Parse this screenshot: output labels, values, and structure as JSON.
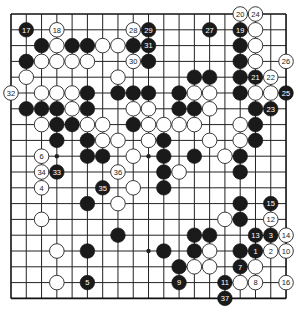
{
  "diagram": {
    "type": "go-board",
    "size": 19,
    "geometry": {
      "left": 11,
      "top": 14,
      "dx": 15.28,
      "dy": 15.8,
      "stone_radius": 7.3
    },
    "colors": {
      "black": "#1a1a1a",
      "white": "#ffffff",
      "line": "#222222",
      "background": "#ffffff"
    },
    "hoshi": [
      [
        3,
        3
      ],
      [
        9,
        3
      ],
      [
        15,
        3
      ],
      [
        3,
        9
      ],
      [
        9,
        9
      ],
      [
        15,
        9
      ],
      [
        3,
        15
      ],
      [
        9,
        15
      ],
      [
        15,
        15
      ]
    ],
    "stones": [
      {
        "c": 15,
        "r": 0,
        "color": "W",
        "label": "20"
      },
      {
        "c": 16,
        "r": 0,
        "color": "W",
        "label": "24"
      },
      {
        "c": 1,
        "r": 1,
        "color": "B",
        "label": "17"
      },
      {
        "c": 3,
        "r": 1,
        "color": "W",
        "label": "18"
      },
      {
        "c": 8,
        "r": 1,
        "color": "W",
        "label": "28"
      },
      {
        "c": 9,
        "r": 1,
        "color": "B",
        "label": "29"
      },
      {
        "c": 13,
        "r": 1,
        "color": "B",
        "label": "27"
      },
      {
        "c": 15,
        "r": 1,
        "color": "B",
        "label": "19"
      },
      {
        "c": 16,
        "r": 1,
        "color": "W",
        "label": ""
      },
      {
        "c": 2,
        "r": 2,
        "color": "B",
        "label": ""
      },
      {
        "c": 3,
        "r": 2,
        "color": "W",
        "label": ""
      },
      {
        "c": 4,
        "r": 2,
        "color": "B",
        "label": ""
      },
      {
        "c": 5,
        "r": 2,
        "color": "B",
        "label": ""
      },
      {
        "c": 6,
        "r": 2,
        "color": "W",
        "label": ""
      },
      {
        "c": 7,
        "r": 2,
        "color": "W",
        "label": ""
      },
      {
        "c": 8,
        "r": 2,
        "color": "B",
        "label": ""
      },
      {
        "c": 9,
        "r": 2,
        "color": "B",
        "label": "31"
      },
      {
        "c": 15,
        "r": 2,
        "color": "B",
        "label": ""
      },
      {
        "c": 16,
        "r": 2,
        "color": "W",
        "label": ""
      },
      {
        "c": 1,
        "r": 3,
        "color": "B",
        "label": ""
      },
      {
        "c": 2,
        "r": 3,
        "color": "W",
        "label": ""
      },
      {
        "c": 3,
        "r": 3,
        "color": "W",
        "label": ""
      },
      {
        "c": 4,
        "r": 3,
        "color": "W",
        "label": ""
      },
      {
        "c": 5,
        "r": 3,
        "color": "W",
        "label": ""
      },
      {
        "c": 8,
        "r": 3,
        "color": "W",
        "label": "30"
      },
      {
        "c": 9,
        "r": 3,
        "color": "B",
        "label": ""
      },
      {
        "c": 15,
        "r": 3,
        "color": "B",
        "label": ""
      },
      {
        "c": 16,
        "r": 3,
        "color": "W",
        "label": ""
      },
      {
        "c": 18,
        "r": 3,
        "color": "W",
        "label": "26"
      },
      {
        "c": 1,
        "r": 4,
        "color": "W",
        "label": ""
      },
      {
        "c": 7,
        "r": 4,
        "color": "W",
        "label": ""
      },
      {
        "c": 12,
        "r": 4,
        "color": "B",
        "label": ""
      },
      {
        "c": 13,
        "r": 4,
        "color": "B",
        "label": ""
      },
      {
        "c": 15,
        "r": 4,
        "color": "B",
        "label": ""
      },
      {
        "c": 16,
        "r": 4,
        "color": "B",
        "label": "21"
      },
      {
        "c": 17,
        "r": 4,
        "color": "W",
        "label": "22"
      },
      {
        "c": 0,
        "r": 5,
        "color": "W",
        "label": "32"
      },
      {
        "c": 2,
        "r": 5,
        "color": "W",
        "label": ""
      },
      {
        "c": 3,
        "r": 5,
        "color": "W",
        "label": ""
      },
      {
        "c": 4,
        "r": 5,
        "color": "W",
        "label": ""
      },
      {
        "c": 5,
        "r": 5,
        "color": "B",
        "label": ""
      },
      {
        "c": 7,
        "r": 5,
        "color": "B",
        "label": ""
      },
      {
        "c": 8,
        "r": 5,
        "color": "B",
        "label": ""
      },
      {
        "c": 9,
        "r": 5,
        "color": "B",
        "label": ""
      },
      {
        "c": 11,
        "r": 5,
        "color": "B",
        "label": ""
      },
      {
        "c": 12,
        "r": 5,
        "color": "W",
        "label": ""
      },
      {
        "c": 13,
        "r": 5,
        "color": "W",
        "label": ""
      },
      {
        "c": 15,
        "r": 5,
        "color": "B",
        "label": ""
      },
      {
        "c": 16,
        "r": 5,
        "color": "W",
        "label": ""
      },
      {
        "c": 17,
        "r": 5,
        "color": "W",
        "label": ""
      },
      {
        "c": 18,
        "r": 5,
        "color": "B",
        "label": "25"
      },
      {
        "c": 1,
        "r": 6,
        "color": "B",
        "label": ""
      },
      {
        "c": 2,
        "r": 6,
        "color": "B",
        "label": ""
      },
      {
        "c": 3,
        "r": 6,
        "color": "B",
        "label": ""
      },
      {
        "c": 4,
        "r": 6,
        "color": "W",
        "label": ""
      },
      {
        "c": 5,
        "r": 6,
        "color": "B",
        "label": ""
      },
      {
        "c": 8,
        "r": 6,
        "color": "W",
        "label": ""
      },
      {
        "c": 9,
        "r": 6,
        "color": "W",
        "label": ""
      },
      {
        "c": 11,
        "r": 6,
        "color": "B",
        "label": ""
      },
      {
        "c": 12,
        "r": 6,
        "color": "B",
        "label": ""
      },
      {
        "c": 13,
        "r": 6,
        "color": "W",
        "label": ""
      },
      {
        "c": 16,
        "r": 6,
        "color": "B",
        "label": ""
      },
      {
        "c": 17,
        "r": 6,
        "color": "B",
        "label": "23"
      },
      {
        "c": 2,
        "r": 7,
        "color": "W",
        "label": ""
      },
      {
        "c": 3,
        "r": 7,
        "color": "B",
        "label": ""
      },
      {
        "c": 4,
        "r": 7,
        "color": "B",
        "label": ""
      },
      {
        "c": 5,
        "r": 7,
        "color": "W",
        "label": ""
      },
      {
        "c": 6,
        "r": 7,
        "color": "W",
        "label": ""
      },
      {
        "c": 8,
        "r": 7,
        "color": "B",
        "label": ""
      },
      {
        "c": 9,
        "r": 7,
        "color": "W",
        "label": ""
      },
      {
        "c": 10,
        "r": 7,
        "color": "W",
        "label": ""
      },
      {
        "c": 11,
        "r": 7,
        "color": "W",
        "label": ""
      },
      {
        "c": 12,
        "r": 7,
        "color": "W",
        "label": ""
      },
      {
        "c": 15,
        "r": 7,
        "color": "W",
        "label": ""
      },
      {
        "c": 16,
        "r": 7,
        "color": "B",
        "label": ""
      },
      {
        "c": 3,
        "r": 8,
        "color": "B",
        "label": ""
      },
      {
        "c": 5,
        "r": 8,
        "color": "B",
        "label": ""
      },
      {
        "c": 6,
        "r": 8,
        "color": "W",
        "label": ""
      },
      {
        "c": 7,
        "r": 8,
        "color": "W",
        "label": ""
      },
      {
        "c": 9,
        "r": 8,
        "color": "W",
        "label": ""
      },
      {
        "c": 10,
        "r": 8,
        "color": "B",
        "label": ""
      },
      {
        "c": 13,
        "r": 8,
        "color": "W",
        "label": ""
      },
      {
        "c": 15,
        "r": 8,
        "color": "W",
        "label": ""
      },
      {
        "c": 16,
        "r": 8,
        "color": "B",
        "label": ""
      },
      {
        "c": 2,
        "r": 9,
        "color": "W",
        "label": "6"
      },
      {
        "c": 5,
        "r": 9,
        "color": "B",
        "label": ""
      },
      {
        "c": 6,
        "r": 9,
        "color": "B",
        "label": ""
      },
      {
        "c": 8,
        "r": 9,
        "color": "W",
        "label": ""
      },
      {
        "c": 10,
        "r": 9,
        "color": "B",
        "label": ""
      },
      {
        "c": 12,
        "r": 9,
        "color": "B",
        "label": ""
      },
      {
        "c": 14,
        "r": 9,
        "color": "W",
        "label": ""
      },
      {
        "c": 15,
        "r": 9,
        "color": "B",
        "label": ""
      },
      {
        "c": 2,
        "r": 10,
        "color": "W",
        "label": "34"
      },
      {
        "c": 3,
        "r": 10,
        "color": "B",
        "label": "33"
      },
      {
        "c": 7,
        "r": 10,
        "color": "W",
        "label": "36"
      },
      {
        "c": 10,
        "r": 10,
        "color": "B",
        "label": ""
      },
      {
        "c": 11,
        "r": 10,
        "color": "W",
        "label": ""
      },
      {
        "c": 15,
        "r": 10,
        "color": "B",
        "label": ""
      },
      {
        "c": 2,
        "r": 11,
        "color": "W",
        "label": "4"
      },
      {
        "c": 6,
        "r": 11,
        "color": "B",
        "label": "35"
      },
      {
        "c": 8,
        "r": 11,
        "color": "W",
        "label": ""
      },
      {
        "c": 10,
        "r": 11,
        "color": "B",
        "label": ""
      },
      {
        "c": 5,
        "r": 12,
        "color": "B",
        "label": ""
      },
      {
        "c": 7,
        "r": 12,
        "color": "W",
        "label": ""
      },
      {
        "c": 15,
        "r": 12,
        "color": "B",
        "label": ""
      },
      {
        "c": 17,
        "r": 12,
        "color": "B",
        "label": "15"
      },
      {
        "c": 2,
        "r": 13,
        "color": "W",
        "label": ""
      },
      {
        "c": 14,
        "r": 13,
        "color": "W",
        "label": ""
      },
      {
        "c": 15,
        "r": 13,
        "color": "B",
        "label": ""
      },
      {
        "c": 17,
        "r": 13,
        "color": "W",
        "label": "12"
      },
      {
        "c": 7,
        "r": 14,
        "color": "B",
        "label": ""
      },
      {
        "c": 12,
        "r": 14,
        "color": "B",
        "label": ""
      },
      {
        "c": 13,
        "r": 14,
        "color": "B",
        "label": ""
      },
      {
        "c": 16,
        "r": 14,
        "color": "B",
        "label": "13"
      },
      {
        "c": 17,
        "r": 14,
        "color": "B",
        "label": "3"
      },
      {
        "c": 18,
        "r": 14,
        "color": "W",
        "label": "14"
      },
      {
        "c": 3,
        "r": 15,
        "color": "W",
        "label": ""
      },
      {
        "c": 5,
        "r": 15,
        "color": "B",
        "label": ""
      },
      {
        "c": 10,
        "r": 15,
        "color": "B",
        "label": ""
      },
      {
        "c": 12,
        "r": 15,
        "color": "B",
        "label": ""
      },
      {
        "c": 13,
        "r": 15,
        "color": "W",
        "label": ""
      },
      {
        "c": 15,
        "r": 15,
        "color": "B",
        "label": ""
      },
      {
        "c": 16,
        "r": 15,
        "color": "B",
        "label": "1"
      },
      {
        "c": 17,
        "r": 15,
        "color": "W",
        "label": "2"
      },
      {
        "c": 18,
        "r": 15,
        "color": "W",
        "label": "10"
      },
      {
        "c": 11,
        "r": 16,
        "color": "B",
        "label": ""
      },
      {
        "c": 12,
        "r": 16,
        "color": "W",
        "label": ""
      },
      {
        "c": 13,
        "r": 16,
        "color": "W",
        "label": ""
      },
      {
        "c": 15,
        "r": 16,
        "color": "B",
        "label": "7"
      },
      {
        "c": 16,
        "r": 16,
        "color": "W",
        "label": ""
      },
      {
        "c": 3,
        "r": 17,
        "color": "W",
        "label": ""
      },
      {
        "c": 5,
        "r": 17,
        "color": "B",
        "label": "5"
      },
      {
        "c": 11,
        "r": 17,
        "color": "B",
        "label": "9"
      },
      {
        "c": 14,
        "r": 17,
        "color": "B",
        "label": "11"
      },
      {
        "c": 15,
        "r": 17,
        "color": "W",
        "label": ""
      },
      {
        "c": 16,
        "r": 17,
        "color": "W",
        "label": "8"
      },
      {
        "c": 18,
        "r": 17,
        "color": "W",
        "label": "16"
      },
      {
        "c": 14,
        "r": 18,
        "color": "B",
        "label": "37"
      }
    ]
  }
}
